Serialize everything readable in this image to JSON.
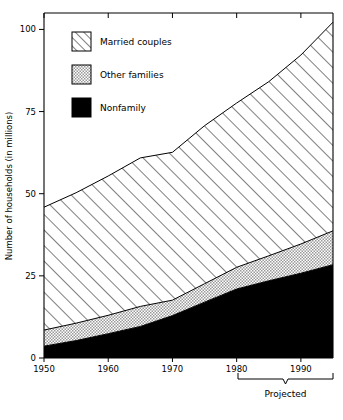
{
  "chart_data": {
    "type": "area",
    "title": "",
    "xlabel": "",
    "ylabel": "Number of households (in millions)",
    "xlim": [
      1950,
      1995
    ],
    "ylim": [
      0,
      105
    ],
    "xticks": [
      1950,
      1960,
      1970,
      1980,
      1990
    ],
    "xticklabels": [
      "1950",
      "1960",
      "1970",
      "1980",
      "1990"
    ],
    "yticks": [
      0,
      25,
      50,
      75,
      100
    ],
    "yticklabels": [
      "0",
      "25",
      "50",
      "75",
      "100"
    ],
    "grid": false,
    "stacked": true,
    "legend_position": "upper-left-inside",
    "x": [
      1950,
      1955,
      1960,
      1965,
      1970,
      1975,
      1980,
      1985,
      1990,
      1995
    ],
    "series": [
      {
        "name": "Nonfamily",
        "fill": "solid-black",
        "color": "#000000",
        "values": [
          3.6,
          5.3,
          7.4,
          9.6,
          12.9,
          17.0,
          21.0,
          23.5,
          25.8,
          28.4
        ]
      },
      {
        "name": "Other families",
        "fill": "stippled-gray",
        "color": "#d0d0d0",
        "values": [
          4.9,
          5.3,
          5.6,
          6.1,
          4.7,
          5.6,
          6.6,
          7.6,
          8.9,
          10.3
        ]
      },
      {
        "name": "Married couples",
        "fill": "diagonal-hatch",
        "color": "#ffffff",
        "values": [
          37.4,
          39.7,
          42.4,
          45.2,
          45.0,
          48.1,
          50.0,
          53.0,
          57.5,
          63.5
        ]
      }
    ],
    "cumulative_totals": [
      45.9,
      50.3,
      55.4,
      60.9,
      62.6,
      70.7,
      77.6,
      84.1,
      92.2,
      102.2
    ],
    "annotation": {
      "label": "Projected",
      "from_x": 1980,
      "to_x": 1995
    }
  },
  "legend": {
    "items": [
      {
        "label": "Married couples",
        "swatch": "diagonal-hatch"
      },
      {
        "label": "Other families",
        "swatch": "stippled-gray"
      },
      {
        "label": "Nonfamily",
        "swatch": "solid-black"
      }
    ]
  }
}
